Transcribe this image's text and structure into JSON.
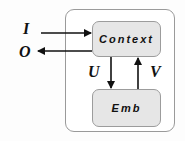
{
  "diagram": {
    "nodes": {
      "context": {
        "label": "Context"
      },
      "emb": {
        "label": "Emb"
      }
    },
    "symbols": {
      "input": "I",
      "output": "O",
      "down": "U",
      "up": "V"
    },
    "edges": [
      {
        "from": "I",
        "to": "Context",
        "label": "I"
      },
      {
        "from": "Context",
        "to": "O",
        "label": "O"
      },
      {
        "from": "Context",
        "to": "Emb",
        "label": "U"
      },
      {
        "from": "Emb",
        "to": "Context",
        "label": "V"
      }
    ],
    "colors": {
      "node_fill": "#e6e6e6",
      "node_border": "#9c9c9c",
      "outer_border": "#9a9a9a",
      "arrow": "#111111"
    }
  }
}
